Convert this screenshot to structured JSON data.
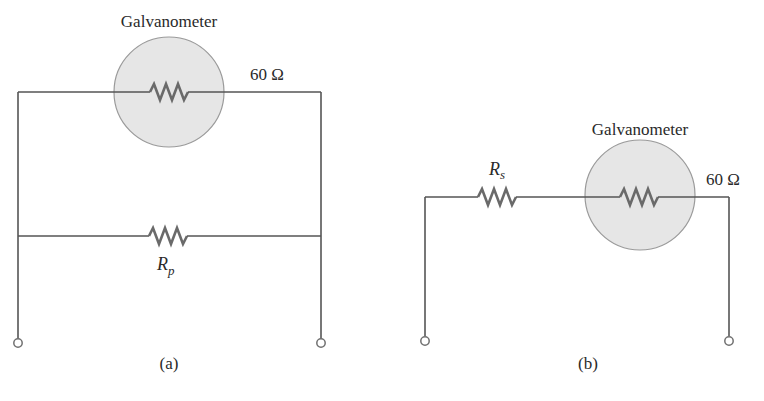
{
  "diagram": {
    "colors": {
      "wire": "#555555",
      "resistor": "#6a6a6a",
      "meter_fill": "#e6e6e6",
      "meter_stroke": "#9a9a9a",
      "text": "#2a2a2a"
    },
    "panel_a": {
      "caption": "(a)",
      "meter_label": "Galvanometer",
      "meter_resistance": "60 Ω",
      "shunt_label_main": "R",
      "shunt_label_sub": "p"
    },
    "panel_b": {
      "caption": "(b)",
      "meter_label": "Galvanometer",
      "meter_resistance": "60 Ω",
      "series_label_main": "R",
      "series_label_sub": "s"
    }
  }
}
